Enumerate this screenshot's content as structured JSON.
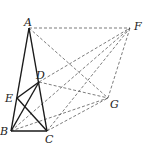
{
  "diagram": {
    "points": {
      "A": {
        "label": "A",
        "x": 29,
        "y": 28
      },
      "F": {
        "label": "F",
        "x": 130,
        "y": 28
      },
      "D": {
        "label": "D",
        "x": 39,
        "y": 82
      },
      "E": {
        "label": "E",
        "x": 17,
        "y": 98
      },
      "G": {
        "label": "G",
        "x": 108,
        "y": 98
      },
      "B": {
        "label": "B",
        "x": 11,
        "y": 131
      },
      "C": {
        "label": "C",
        "x": 47,
        "y": 131
      }
    },
    "solid_segments": [
      [
        "A",
        "B"
      ],
      [
        "A",
        "C"
      ],
      [
        "B",
        "C"
      ],
      [
        "D",
        "E"
      ],
      [
        "B",
        "D"
      ],
      [
        "E",
        "C"
      ]
    ],
    "dashed_segments": [
      [
        "A",
        "F"
      ],
      [
        "A",
        "G"
      ],
      [
        "D",
        "F"
      ],
      [
        "B",
        "F"
      ],
      [
        "C",
        "F"
      ],
      [
        "G",
        "F"
      ],
      [
        "D",
        "G"
      ],
      [
        "B",
        "G"
      ],
      [
        "C",
        "G"
      ]
    ]
  }
}
